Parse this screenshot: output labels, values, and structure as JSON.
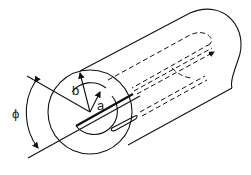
{
  "figure": {
    "labels": {
      "outer_radius": "b",
      "inner_radius": "a",
      "angle": "ϕ"
    },
    "colors": {
      "line": "#111111",
      "background": "#ffffff"
    }
  }
}
